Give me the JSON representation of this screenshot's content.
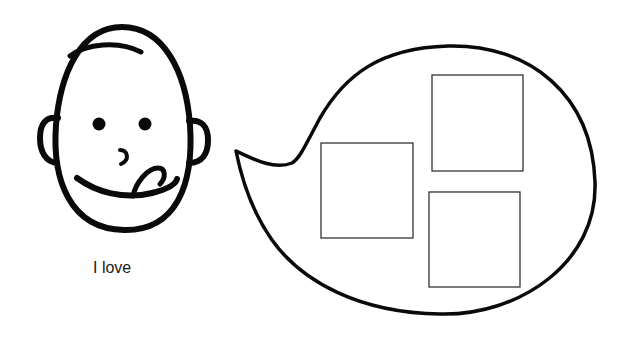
{
  "caption": {
    "text": "I love"
  },
  "colors": {
    "stroke": "#0a0a0a",
    "box_stroke": "#333333",
    "background": "#ffffff"
  },
  "face": {
    "expression": "licking-lips",
    "icon": "face-icon"
  },
  "speech_bubble": {
    "icon": "speech-bubble-icon",
    "boxes": [
      {
        "id": "left",
        "x": 321,
        "y": 143,
        "w": 92,
        "h": 95
      },
      {
        "id": "top-right",
        "x": 432,
        "y": 75,
        "w": 91,
        "h": 96
      },
      {
        "id": "bottom-right",
        "x": 429,
        "y": 192,
        "w": 91,
        "h": 95
      }
    ]
  }
}
